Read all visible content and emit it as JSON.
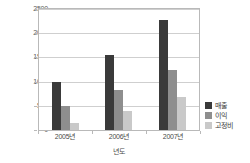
{
  "chart_data": {
    "type": "bar",
    "title": "",
    "subtitle": "",
    "xlabel": "년도",
    "ylabel": "",
    "categories": [
      "2005년",
      "2006년",
      "2007년"
    ],
    "series": [
      {
        "name": "매출",
        "values": [
          990,
          1550,
          2280
        ],
        "color": "#3a3a3a"
      },
      {
        "name": "이익",
        "values": [
          490,
          830,
          1240
        ],
        "color": "#8e8e8e"
      },
      {
        "name": "고정비",
        "values": [
          145,
          400,
          680
        ],
        "color": "#c9c9c9"
      }
    ],
    "ylim": [
      0,
      2500
    ],
    "yticks": [
      0,
      500,
      1000,
      1500,
      2000,
      2500
    ],
    "ytick_labels": [
      "0",
      "500",
      "1000",
      "1500",
      "2000",
      "2500"
    ],
    "grid": true,
    "grid_axis": "y",
    "legend_position": "right",
    "bar_group_count": 3,
    "bars_per_group": 3
  },
  "axes": {
    "y_axis_name": "value-axis",
    "x_axis_name": "year-axis"
  }
}
